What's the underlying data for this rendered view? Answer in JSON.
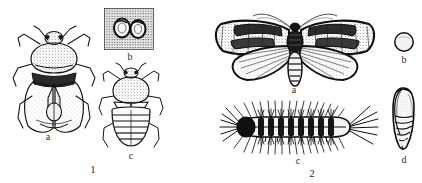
{
  "plate": {
    "background_color": "#ffffff",
    "ink_color": "#1a1a1a",
    "width": 422,
    "height": 183,
    "style": "black-and-white stippled scientific line drawing"
  },
  "figures": [
    {
      "number": "1",
      "number_label": "1",
      "subject": "shield bug / stink bug life stages",
      "parts": [
        {
          "key": "1a",
          "label": "a",
          "name": "adult-bug-dorsal",
          "description": "adult bug seen from above with spread legs and antennae"
        },
        {
          "key": "1b",
          "label": "b",
          "name": "egg-mass-stippled-patch",
          "description": "two eggs on a stippled rectangular patch"
        },
        {
          "key": "1c",
          "label": "c",
          "name": "nymph-dorsal",
          "description": "nymph with banded abdomen seen from above"
        }
      ]
    },
    {
      "number": "2",
      "number_label": "2",
      "subject": "tussock moth life stages",
      "parts": [
        {
          "key": "2a",
          "label": "a",
          "name": "adult-moth-wings-spread",
          "description": "adult moth with patterned wings spread and feathered antennae"
        },
        {
          "key": "2b",
          "label": "b",
          "name": "egg-circular",
          "description": "single round stippled egg"
        },
        {
          "key": "2c",
          "label": "c",
          "name": "larva-hairy-caterpillar",
          "description": "hairy bristled caterpillar in lateral view"
        },
        {
          "key": "2d",
          "label": "d",
          "name": "pupa",
          "description": "segmented pupa in lateral view"
        }
      ]
    }
  ]
}
